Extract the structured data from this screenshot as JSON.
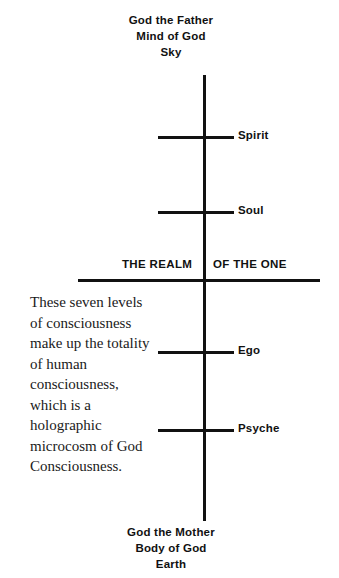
{
  "diagram": {
    "axis_color": "#111111",
    "background": "#ffffff",
    "top_pole": {
      "line1": "God the Father",
      "line2": "Mind of God",
      "line3": "Sky"
    },
    "bottom_pole": {
      "line1": "God the Mother",
      "line2": "Body of God",
      "line3": "Earth"
    },
    "divider": {
      "left_label": "THE REALM",
      "right_label": "OF THE ONE"
    },
    "tiers": [
      {
        "label": "Spirit",
        "position": "upper-1"
      },
      {
        "label": "Soul",
        "position": "upper-2"
      },
      {
        "label": "Ego",
        "position": "lower-1"
      },
      {
        "label": "Psyche",
        "position": "lower-2"
      }
    ],
    "note": "These seven levels of consciousness make up the totality of human consciousness, which is a holographic microcosm of God Consciousness."
  }
}
